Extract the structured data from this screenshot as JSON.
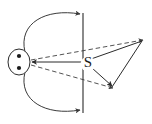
{
  "figure": {
    "width": 152,
    "height": 124,
    "background_color": "#ffffff",
    "stroke_color": "#2b2b2b",
    "dash_color": "#4a4a4a",
    "labels": [
      {
        "name": "point-label-s",
        "text": "S",
        "x": 88,
        "y": 64
      }
    ],
    "source": {
      "name": "source-ellipse",
      "cx": 19,
      "cy": 62,
      "rx": 11,
      "ry": 13,
      "dots": [
        {
          "name": "source-dot-upper",
          "cx": 19,
          "cy": 56,
          "r": 2
        },
        {
          "name": "source-dot-lower",
          "cx": 19,
          "cy": 68,
          "r": 2
        }
      ]
    },
    "vertical_line": {
      "name": "screen-vertical-line",
      "x": 83,
      "y1": 13,
      "y2": 113
    },
    "curves": [
      {
        "name": "curved-arrow-upper",
        "path": "M 25 52 C 20 24 46 9 80 14",
        "arrow": true
      },
      {
        "name": "curved-arrow-lower",
        "path": "M 25 72 C 20 100 46 115 80 110",
        "arrow": true
      }
    ],
    "solid_rays": [
      {
        "name": "ray-source-to-s",
        "x1": 86,
        "y1": 62,
        "x2": 31,
        "y2": 62,
        "arrow": true
      },
      {
        "name": "ray-s-to-right-vertex",
        "x1": 90,
        "y1": 59,
        "x2": 142,
        "y2": 41,
        "arrow": false
      },
      {
        "name": "ray-s-to-bottom-vertex",
        "x1": 91,
        "y1": 68,
        "x2": 112,
        "y2": 87,
        "arrow": true
      },
      {
        "name": "ray-bottom-vertex-to-right-vertex",
        "x1": 112,
        "y1": 87,
        "x2": 142,
        "y2": 41,
        "arrow": false
      }
    ],
    "dashed_rays": [
      {
        "name": "dashed-ray-upper",
        "x1": 31,
        "y1": 60,
        "x2": 143,
        "y2": 40,
        "arrow": true
      },
      {
        "name": "dashed-ray-lower",
        "x1": 31,
        "y1": 65,
        "x2": 113,
        "y2": 88,
        "arrow": true
      }
    ],
    "vertices": [
      {
        "name": "right-convergence-point",
        "x": 142,
        "y": 41
      },
      {
        "name": "bottom-convergence-point",
        "x": 112,
        "y": 87
      }
    ]
  }
}
